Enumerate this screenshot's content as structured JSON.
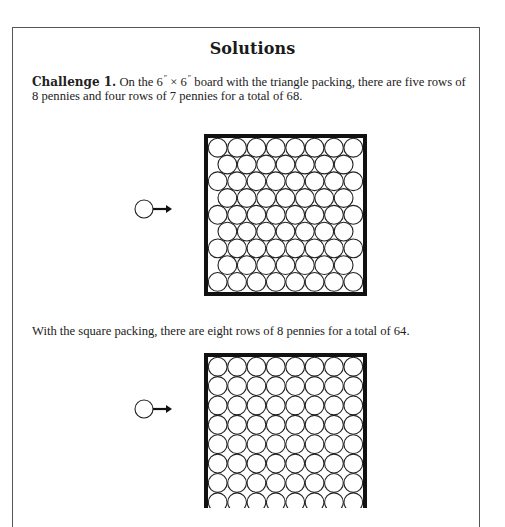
{
  "document": {
    "title": "Solutions",
    "challenge": {
      "label": "Challenge 1.",
      "text_part1": " On the 6",
      "prime1": "″",
      "times": " × 6",
      "prime2": "″",
      "text_part2": " board with the triangle packing, there are five rows of 8 pennies and four rows of 7 pennies for a total of 68."
    },
    "square_packing_text": "With the square packing, there are eight rows of 8 pennies for a total of 64."
  },
  "figures": [
    {
      "name": "triangle-packing-board",
      "packing": "triangle",
      "board_size": "6″ × 6″",
      "rows": [
        8,
        7,
        8,
        7,
        8,
        7,
        8,
        7,
        8
      ],
      "total_pennies": 68
    },
    {
      "name": "square-packing-board",
      "packing": "square",
      "board_size": "6″ × 6″",
      "rows": [
        8,
        8,
        8,
        8,
        8,
        8,
        8,
        8
      ],
      "total_pennies": 64
    }
  ],
  "icons": {
    "penny_arrow": "penny-with-arrow-icon"
  },
  "colors": {
    "ink": "#1a1a1a",
    "frame": "#111111",
    "page_border": "#555555",
    "background": "#ffffff"
  }
}
